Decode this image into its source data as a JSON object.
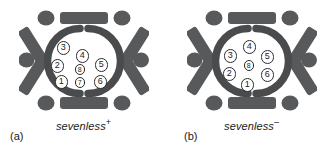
{
  "figure": {
    "type": "biological-diagram",
    "colors": {
      "pigment_cell_gray": "#58595b",
      "ring_gray": "#4a4b4d",
      "cell_outline": "#2b2b2b",
      "cell_fill": "#ffffff",
      "background": "#ffffff",
      "text": "#1a1a1a"
    },
    "panels": [
      {
        "id": "a",
        "label": "(a)",
        "genotype_name": "sevenless",
        "genotype_superscript": "+",
        "genotype_full": "sevenless+",
        "cell_count": 8,
        "cells": [
          {
            "id": "1",
            "label": "1",
            "size": "big",
            "x": 36,
            "y": 71
          },
          {
            "id": "2",
            "label": "2",
            "size": "big",
            "x": 32,
            "y": 55
          },
          {
            "id": "3",
            "label": "3",
            "size": "big",
            "x": 38,
            "y": 37
          },
          {
            "id": "4",
            "label": "4",
            "size": "big",
            "x": 57,
            "y": 45
          },
          {
            "id": "5",
            "label": "5",
            "size": "big",
            "x": 76,
            "y": 54
          },
          {
            "id": "6",
            "label": "6",
            "size": "big",
            "x": 75,
            "y": 71
          },
          {
            "id": "7",
            "label": "7",
            "size": "small",
            "x": 56,
            "y": 73
          },
          {
            "id": "8",
            "label": "8",
            "size": "small",
            "x": 56,
            "y": 60
          }
        ]
      },
      {
        "id": "b",
        "label": "(b)",
        "genotype_name": "sevenless",
        "genotype_superscript": "–",
        "genotype_full": "sevenless–",
        "cell_count": 7,
        "cells": [
          {
            "id": "1",
            "label": "1",
            "size": "big",
            "x": 54,
            "y": 74
          },
          {
            "id": "2",
            "label": "2",
            "size": "big",
            "x": 36,
            "y": 63
          },
          {
            "id": "3",
            "label": "3",
            "size": "big",
            "x": 37,
            "y": 45
          },
          {
            "id": "4",
            "label": "4",
            "size": "big",
            "x": 56,
            "y": 36
          },
          {
            "id": "5",
            "label": "5",
            "size": "big",
            "x": 74,
            "y": 46
          },
          {
            "id": "6",
            "label": "6",
            "size": "big",
            "x": 74,
            "y": 64
          },
          {
            "id": "8",
            "label": "8",
            "size": "small",
            "x": 57,
            "y": 56
          }
        ]
      }
    ],
    "hexagon": {
      "vertex_circle_count": 6,
      "edge_bar_count": 6,
      "inner_ring_arcs": 2,
      "ring_gap_positions": [
        "top",
        "bottom"
      ]
    }
  }
}
